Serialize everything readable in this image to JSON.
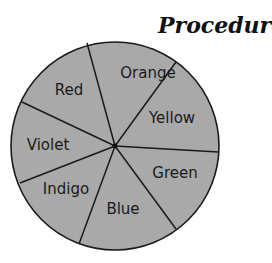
{
  "header": {
    "title": "Procedure:"
  },
  "wheel": {
    "fill_color": "#a8a8a8",
    "stroke_color": "#1a1a1a",
    "center": [
      115,
      146
    ],
    "radius": 104,
    "segments": [
      {
        "label": "Orange",
        "x": 148,
        "y": 78
      },
      {
        "label": "Yellow",
        "x": 172,
        "y": 123
      },
      {
        "label": "Green",
        "x": 173,
        "y": 178
      },
      {
        "label": "Blue",
        "x": 125,
        "y": 214
      },
      {
        "label": "Indigo",
        "x": 66,
        "y": 194
      },
      {
        "label": "Violet",
        "x": 43,
        "y": 150
      },
      {
        "label": "Red",
        "x": 69,
        "y": 95
      }
    ]
  }
}
